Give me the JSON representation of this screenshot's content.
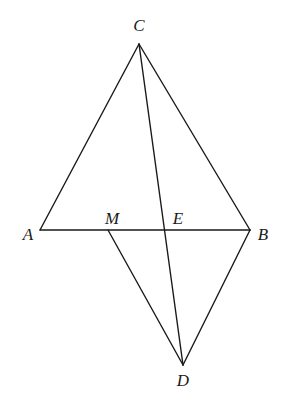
{
  "diagram": {
    "type": "geometry",
    "points": {
      "C": {
        "x": 139,
        "y": 44,
        "label": "C",
        "lx": 139,
        "ly": 31
      },
      "A": {
        "x": 40,
        "y": 230,
        "label": "A",
        "lx": 28,
        "ly": 240
      },
      "B": {
        "x": 250,
        "y": 230,
        "label": "B",
        "lx": 263,
        "ly": 240
      },
      "M": {
        "x": 108,
        "y": 230,
        "label": "M",
        "lx": 112,
        "ly": 224
      },
      "E": {
        "x": 165,
        "y": 230,
        "label": "E",
        "lx": 178,
        "ly": 224
      },
      "D": {
        "x": 183,
        "y": 365,
        "label": "D",
        "lx": 183,
        "ly": 386
      }
    },
    "segments": [
      [
        "C",
        "A"
      ],
      [
        "C",
        "B"
      ],
      [
        "A",
        "B"
      ],
      [
        "C",
        "D"
      ],
      [
        "M",
        "D"
      ],
      [
        "B",
        "D"
      ]
    ]
  }
}
